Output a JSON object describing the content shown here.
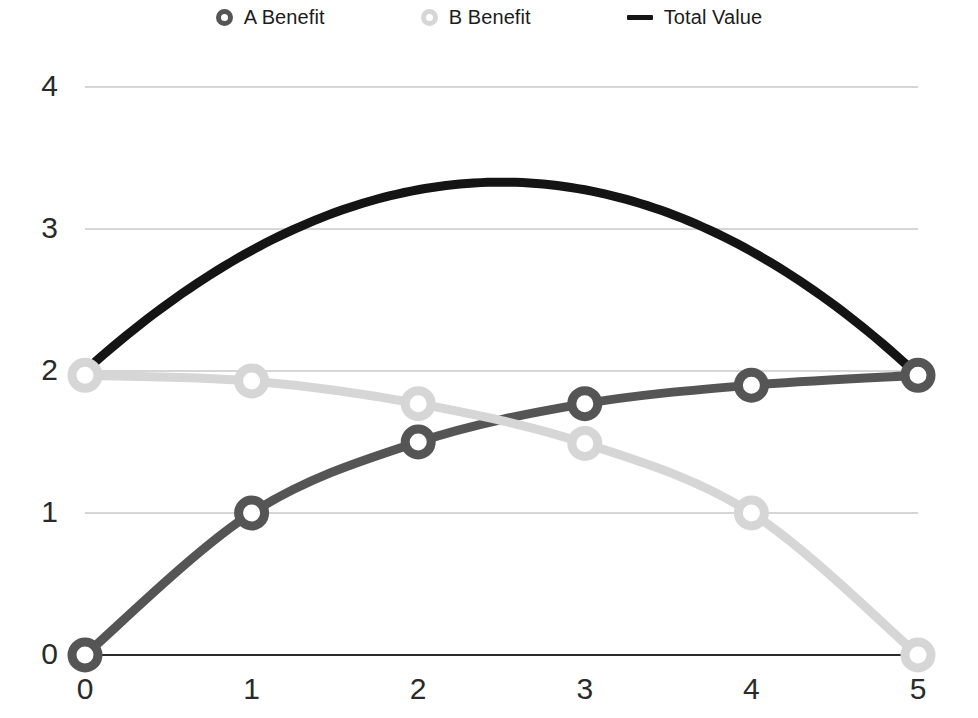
{
  "legend": {
    "items": [
      {
        "label": "A Benefit",
        "marker": "ring-marker-dark",
        "color": "#555555"
      },
      {
        "label": "B Benefit",
        "marker": "ring-marker-light",
        "color": "#d6d6d6"
      },
      {
        "label": "Total Value",
        "marker": "line-marker-black",
        "color": "#141414"
      }
    ]
  },
  "axes": {
    "y_ticks": [
      "0",
      "1",
      "2",
      "3",
      "4"
    ],
    "x_ticks": [
      "0",
      "1",
      "2",
      "3",
      "4",
      "5"
    ]
  },
  "chart_data": {
    "type": "line",
    "title": "",
    "xlabel": "",
    "ylabel": "",
    "xlim": [
      0,
      5
    ],
    "ylim": [
      0,
      4
    ],
    "grid": true,
    "legend_position": "top-center",
    "x": [
      0,
      1,
      2,
      3,
      4,
      5
    ],
    "series": [
      {
        "name": "A Benefit",
        "color": "#555555",
        "marker": "circle-open",
        "values": [
          0,
          1.0,
          1.5,
          1.77,
          1.9,
          1.97
        ]
      },
      {
        "name": "B Benefit",
        "color": "#d6d6d6",
        "marker": "circle-open",
        "values": [
          1.97,
          1.93,
          1.77,
          1.49,
          1.0,
          0
        ]
      },
      {
        "name": "Total Value",
        "color": "#141414",
        "marker": "none",
        "smooth": true,
        "values": [
          2.0,
          2.93,
          3.27,
          3.26,
          2.9,
          1.97
        ],
        "peak": {
          "x": 2.5,
          "y": 3.33
        }
      }
    ]
  }
}
